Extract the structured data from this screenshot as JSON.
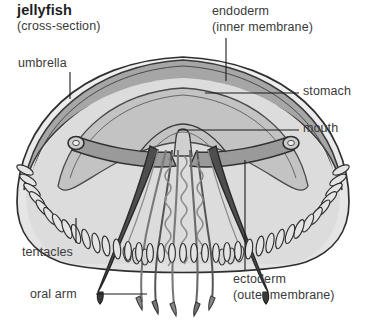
{
  "figure": {
    "title": "jellyfish",
    "subtitle": "(cross-section)",
    "background_color": "#ffffff",
    "label_color": "#3a3a3a",
    "title_color": "#1d1d1d",
    "line_color": "#111111",
    "palette": {
      "bell_fill": "#e9e9e9",
      "bell_inner_fill": "#d2d2d2",
      "mesoglea_fill": "#a9a9a9",
      "dark_outline": "#3d3d3d",
      "mid_gray": "#8d8d8d",
      "light_gray": "#f2f2f2"
    },
    "labels": [
      {
        "id": "umbrella",
        "text": "umbrella",
        "x": 18,
        "y": 56
      },
      {
        "id": "endoderm",
        "text": "endoderm",
        "sub": "(inner membrane)",
        "x": 212,
        "y": 4
      },
      {
        "id": "stomach",
        "text": "stomach",
        "x": 303,
        "y": 84
      },
      {
        "id": "mouth",
        "text": "mouth",
        "x": 303,
        "y": 121
      },
      {
        "id": "tentacles",
        "text": "tentacles",
        "x": 22,
        "y": 245
      },
      {
        "id": "oral-arm",
        "text": "oral arm",
        "x": 30,
        "y": 287
      },
      {
        "id": "ectoderm",
        "text": "ectoderm",
        "sub": "(outer membrane)",
        "x": 233,
        "y": 272
      }
    ],
    "leader_lines": [
      {
        "id": "umbrella",
        "orientation": "vertical",
        "x1": 70,
        "y1": 72,
        "x2": 70,
        "y2": 99
      },
      {
        "id": "endoderm",
        "orientation": "vertical",
        "x1": 226,
        "y1": 38,
        "x2": 226,
        "y2": 81
      },
      {
        "id": "stomach",
        "orientation": "horizontal",
        "x1": 205,
        "y1": 93,
        "x2": 299,
        "y2": 93
      },
      {
        "id": "mouth",
        "orientation": "horizontal",
        "x1": 178,
        "y1": 130,
        "x2": 299,
        "y2": 130
      },
      {
        "id": "tentacles",
        "orientation": "vertical",
        "x1": 76,
        "y1": 218,
        "x2": 76,
        "y2": 243
      },
      {
        "id": "oral-arm",
        "orientation": "horizontal",
        "x1": 96,
        "y1": 294,
        "x2": 147,
        "y2": 294
      },
      {
        "id": "ectoderm",
        "orientation": "vertical",
        "x1": 245,
        "y1": 160,
        "x2": 245,
        "y2": 270
      }
    ]
  }
}
